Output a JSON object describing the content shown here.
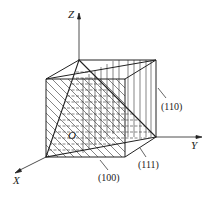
{
  "axes": {
    "x_label": "X",
    "y_label": "Y",
    "z_label": "Z",
    "origin_label": "O"
  },
  "planes": [
    {
      "label": "(100)",
      "hatch": "diagonal"
    },
    {
      "label": "(110)",
      "hatch": "vertical"
    },
    {
      "label": "(111)",
      "hatch": "dashed-horizontal"
    }
  ],
  "colors": {
    "line": "#222222",
    "background": "#ffffff"
  }
}
